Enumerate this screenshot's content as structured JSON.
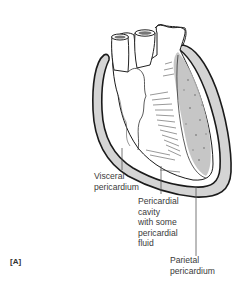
{
  "figure": {
    "panel_label": "[A]",
    "labels": {
      "visceral": "Visceral\npericardium",
      "cavity": "Pericardial\ncavity\nwith some\npericardial\nfluid",
      "parietal": "Parietal\npericardium"
    },
    "colors": {
      "sac_fill": "#d4d4d4",
      "outline": "#1a1a1a",
      "leader": "#555555"
    }
  }
}
